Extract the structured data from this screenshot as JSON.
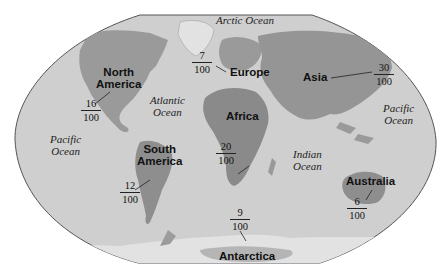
{
  "map": {
    "title": "World continents area fractions",
    "colors": {
      "ocean": "#cfcfcf",
      "land_dark": "#8a8a8a",
      "land_mid": "#a6a6a6",
      "outline": "#555555",
      "ice": "#e4e4e4"
    },
    "continents": [
      {
        "name_line1": "North",
        "name_line2": "America",
        "numerator": "16",
        "denominator": "100"
      },
      {
        "name_line1": "South",
        "name_line2": "America",
        "numerator": "12",
        "denominator": "100"
      },
      {
        "name_line1": "Europe",
        "numerator": "7",
        "denominator": "100"
      },
      {
        "name_line1": "Africa",
        "numerator": "20",
        "denominator": "100"
      },
      {
        "name_line1": "Asia",
        "numerator": "30",
        "denominator": "100"
      },
      {
        "name_line1": "Australia",
        "numerator": "6",
        "denominator": "100"
      },
      {
        "name_line1": "Antarctica",
        "numerator": "9",
        "denominator": "100"
      }
    ],
    "oceans": [
      {
        "line1": "Arctic Ocean"
      },
      {
        "line1": "Atlantic",
        "line2": "Ocean"
      },
      {
        "line1": "Pacific",
        "line2": "Ocean"
      },
      {
        "line1": "Indian",
        "line2": "Ocean"
      },
      {
        "line1": "Pacific",
        "line2": "Ocean"
      }
    ]
  }
}
